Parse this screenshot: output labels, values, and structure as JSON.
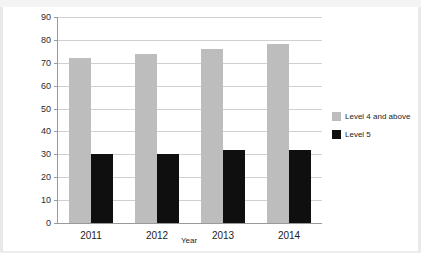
{
  "page": {
    "top_strip_text": "",
    "background_color": "#ffffff",
    "edge_color": "#e9e9e9"
  },
  "chart_data": {
    "type": "bar",
    "title": "",
    "subtitle": "",
    "xlabel": "Year",
    "ylabel": "Percentage of pupils",
    "categories": [
      "2011",
      "2012",
      "2013",
      "2014"
    ],
    "series": [
      {
        "name": "Level 4 and above",
        "color": "#bdbdbd",
        "values": [
          72,
          74,
          76,
          78
        ]
      },
      {
        "name": "Level 5",
        "color": "#0f0f0f",
        "values": [
          30,
          30,
          32,
          32
        ]
      }
    ],
    "ylim": [
      0,
      90
    ],
    "ytick_step": 10,
    "yticks": [
      0,
      10,
      20,
      30,
      40,
      50,
      60,
      70,
      80,
      90
    ],
    "ytick_labels": [
      "0",
      "10",
      "20",
      "30",
      "40",
      "50",
      "60",
      "70",
      "80",
      "90"
    ],
    "grid": true,
    "grid_axis": "y",
    "legend": true,
    "legend_position": "right",
    "bar_group_gap": true
  }
}
